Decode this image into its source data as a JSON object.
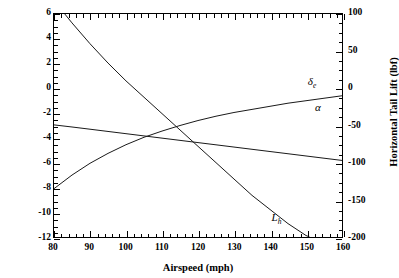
{
  "chart_data": {
    "type": "line",
    "title": "",
    "xlabel": "Airspeed (mph)",
    "ylabel": "Angle (degrees)",
    "ylabel_right": "Horizontal Tail Lift (lbf)",
    "xlim": [
      80,
      160
    ],
    "ylim": [
      -12,
      6
    ],
    "ylim_right": [
      -200,
      100
    ],
    "xticks": [
      80,
      90,
      100,
      110,
      120,
      130,
      140,
      150,
      160
    ],
    "xticklabels": [
      "80",
      "90",
      "100",
      "110",
      "120",
      "130",
      "140",
      "150",
      "160"
    ],
    "yticks": [
      -12,
      -10,
      -8,
      -6,
      -4,
      -2,
      0,
      2,
      4,
      6
    ],
    "yticklabels": [
      "-12",
      "-10",
      "-8",
      "-6",
      "-4",
      "-2",
      "0",
      "2",
      "4",
      "6"
    ],
    "yticks_right": [
      -200,
      -150,
      -100,
      -50,
      0,
      50,
      100
    ],
    "yticklabels_right": [
      "-200",
      "-150",
      "-100",
      "-50",
      "0",
      "50",
      "100"
    ],
    "xminor_step": 2,
    "yminor_step": 0.5,
    "yminor_step_right": 12.5,
    "grid": false,
    "legend": "inline-annotations",
    "series": [
      {
        "name": "alpha",
        "label": "α",
        "label_html": "α",
        "axis": "left",
        "color": "#1a1a1a",
        "annotation_x": 152,
        "annotation_y": -1.55,
        "x": [
          80,
          85,
          90,
          95,
          100,
          105,
          110,
          115,
          120,
          125,
          130,
          135,
          140,
          145,
          150,
          155,
          160
        ],
        "y": [
          -2.95,
          -3.12,
          -3.3,
          -3.48,
          -3.66,
          -3.84,
          -4.02,
          -4.2,
          -4.38,
          -4.56,
          -4.74,
          -4.92,
          -5.1,
          -5.28,
          -5.46,
          -5.64,
          -5.82
        ]
      },
      {
        "name": "delta_e",
        "label": "δe",
        "label_html": "δ<sub>e</sub>",
        "axis": "left",
        "color": "#1a1a1a",
        "annotation_x": 150,
        "annotation_y": 0.55,
        "x": [
          80,
          85,
          90,
          95,
          100,
          105,
          110,
          115,
          120,
          125,
          130,
          135,
          140,
          145,
          150,
          155,
          160
        ],
        "y": [
          -8.1,
          -7.0,
          -6.05,
          -5.25,
          -4.55,
          -3.95,
          -3.45,
          -3.0,
          -2.6,
          -2.25,
          -1.95,
          -1.7,
          -1.45,
          -1.2,
          -1.0,
          -0.8,
          -0.6
        ]
      },
      {
        "name": "L_h",
        "label": "Lh",
        "label_html": "L<sub>h</sub>",
        "axis": "right",
        "color": "#1a1a1a",
        "annotation_x": 140,
        "annotation_y": -172,
        "x": [
          80,
          83,
          85,
          90,
          95,
          100,
          105,
          110,
          115,
          120,
          125,
          130,
          135,
          140,
          145,
          150,
          151
        ],
        "y": [
          138,
          100,
          88,
          60,
          34,
          10,
          -12,
          -34,
          -56,
          -78,
          -100,
          -122,
          -144,
          -163,
          -182,
          -198,
          -200
        ]
      }
    ]
  }
}
